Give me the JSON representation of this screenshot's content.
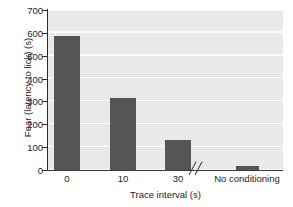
{
  "chart_data": {
    "type": "bar",
    "title": "",
    "subtitle": "",
    "xlabel": "Trace interval (s)",
    "ylabel": "Fear (latency to lick) (s)",
    "categories": [
      "0",
      "10",
      "30",
      "No conditioning"
    ],
    "values": [
      610,
      330,
      135,
      20
    ],
    "ylim": [
      0,
      730
    ],
    "yticks": [
      0,
      100,
      200,
      300,
      400,
      500,
      600,
      700
    ],
    "ytick_labels": [
      "0",
      "100",
      "200",
      "300",
      "400",
      "500",
      "600",
      "700"
    ],
    "xtick_labels": [
      "0",
      "10",
      "30",
      "No conditioning"
    ],
    "grid": "horizontal-white-on-gray",
    "legend": "none",
    "annotations": [
      "axis-break between 30 and No conditioning"
    ],
    "colors": {
      "bar": "#555555",
      "plot_background": "#e9e9e9",
      "gridline": "#fbfbfb",
      "axis": "#2a2a2a",
      "text": "#1c1c1c",
      "figure_background": "#ffffff"
    }
  }
}
